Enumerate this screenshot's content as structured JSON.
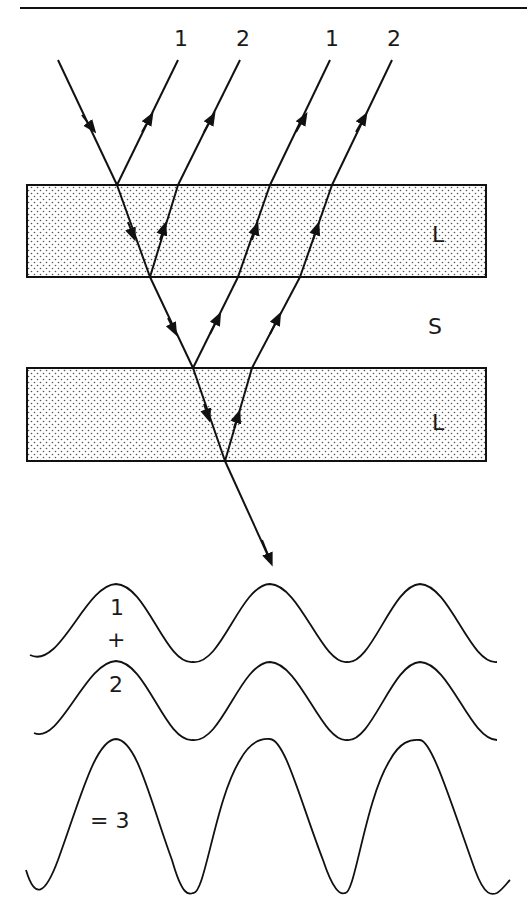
{
  "figure": {
    "ray_labels": [
      "1",
      "2",
      "1",
      "2"
    ],
    "layer_labels": {
      "upper_layer": "L",
      "spacer": "S",
      "lower_layer": "L"
    },
    "wave_labels": {
      "wave1": "1",
      "plus": "+",
      "wave2": "2",
      "result": "= 3"
    },
    "colors": {
      "ink": "#111111",
      "background": "#ffffff",
      "dot_fill": "#555555"
    }
  }
}
